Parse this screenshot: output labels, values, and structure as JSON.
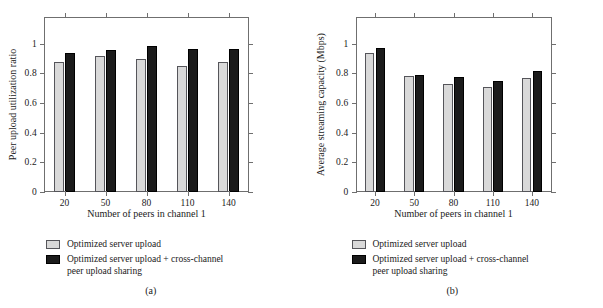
{
  "figure": {
    "panels": [
      {
        "caption": "(a)",
        "ylabel": "Peer upload utilization ratio",
        "xlabel": "Number of peers in channel 1",
        "legend": [
          {
            "label": "Optimized server upload",
            "color": "#d9d9d9"
          },
          {
            "label": "Optimized server upload + cross-channel\npeer upload sharing",
            "color": "#1b1b1b"
          }
        ]
      },
      {
        "caption": "(b)",
        "ylabel": "Average streaming capacity (Mbps)",
        "xlabel": "Number of peers in channel 1",
        "legend": [
          {
            "label": "Optimized server upload",
            "color": "#d9d9d9"
          },
          {
            "label": "Optimized server upload + cross-channel\npeer upload sharing",
            "color": "#1b1b1b"
          }
        ]
      }
    ]
  },
  "chart_data": [
    {
      "type": "bar",
      "title": "(a)",
      "xlabel": "Number of peers in channel 1",
      "ylabel": "Peer upload utilization ratio",
      "categories": [
        "20",
        "50",
        "80",
        "110",
        "140"
      ],
      "yticks": [
        0,
        0.2,
        0.4,
        0.6,
        0.8,
        1
      ],
      "ytick_labels": [
        "0",
        "0.2",
        "0.4",
        "0.6",
        "0.8",
        "1"
      ],
      "ylim": [
        0,
        1.18
      ],
      "grid": false,
      "legend_position": "below-axes",
      "series": [
        {
          "name": "Optimized server upload",
          "color": "#d9d9d9",
          "values": [
            0.875,
            0.92,
            0.895,
            0.85,
            0.88
          ]
        },
        {
          "name": "Optimized server upload + cross-channel peer upload sharing",
          "color": "#1b1b1b",
          "values": [
            0.94,
            0.955,
            0.985,
            0.965,
            0.965
          ]
        }
      ]
    },
    {
      "type": "bar",
      "title": "(b)",
      "xlabel": "Number of peers in channel 1",
      "ylabel": "Average streaming capacity (Mbps)",
      "categories": [
        "20",
        "50",
        "80",
        "110",
        "140"
      ],
      "yticks": [
        0,
        0.2,
        0.4,
        0.6,
        0.8,
        1
      ],
      "ytick_labels": [
        "0",
        "0.2",
        "0.4",
        "0.6",
        "0.8",
        "1"
      ],
      "ylim": [
        0,
        1.18
      ],
      "grid": false,
      "legend_position": "below-axes",
      "series": [
        {
          "name": "Optimized server upload",
          "color": "#d9d9d9",
          "values": [
            0.935,
            0.78,
            0.73,
            0.705,
            0.77
          ]
        },
        {
          "name": "Optimized server upload + cross-channel peer upload sharing",
          "color": "#1b1b1b",
          "values": [
            0.97,
            0.79,
            0.775,
            0.75,
            0.815
          ]
        }
      ]
    }
  ]
}
